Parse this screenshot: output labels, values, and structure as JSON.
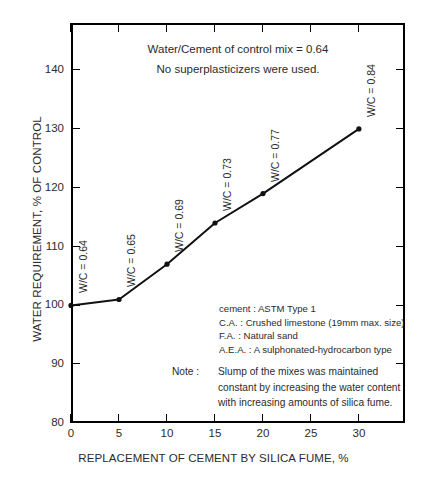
{
  "chart_data": {
    "type": "line",
    "title": "",
    "xlabel": "REPLACEMENT OF CEMENT BY SILICA FUME, %",
    "ylabel": "WATER REQUIREMENT, % OF CONTROL",
    "xlim": [
      0,
      34.8
    ],
    "ylim": [
      80,
      148
    ],
    "grid": false,
    "legend": "none",
    "x": [
      0,
      5,
      10,
      15,
      20,
      30
    ],
    "values": [
      100,
      101,
      107,
      114,
      119,
      130
    ],
    "series": [
      {
        "name": "Water requirement",
        "values": [
          100,
          101,
          107,
          114,
          119,
          130
        ]
      }
    ],
    "point_labels": [
      "W/C = 0.64",
      "W/C = 0.65",
      "W/C = 0.69",
      "W/C = 0.73",
      "W/C = 0.77",
      "W/C = 0.84"
    ],
    "xticks": [
      0,
      5,
      10,
      15,
      20,
      25,
      30
    ],
    "xtick_labels": [
      "0",
      "5",
      "10",
      "15",
      "20",
      "25",
      "30"
    ],
    "yticks": [
      80,
      90,
      100,
      110,
      120,
      130,
      140
    ],
    "ytick_labels": [
      "80",
      "90",
      "100",
      "110",
      "120",
      "130",
      "140"
    ],
    "annotations": {
      "header_line1": "Water/Cement of control mix = 0.64",
      "header_line2": "No superplasticizers were used.",
      "materials": [
        "cement : ASTM Type 1",
        "C.A. : Crushed limestone (19mm max. size)",
        "F.A. : Natural sand",
        "A.E.A. : A sulphonated-hydrocarbon type"
      ],
      "note_label": "Note :",
      "note_lines": [
        "Slump of the mixes was maintained",
        "constant by increasing the water content",
        "with increasing amounts of silica fume."
      ]
    },
    "colors": {
      "line": "#111111",
      "marker": "#111111",
      "axis": "#000000",
      "text": "#2b2b2b",
      "background": "#ffffff"
    }
  }
}
